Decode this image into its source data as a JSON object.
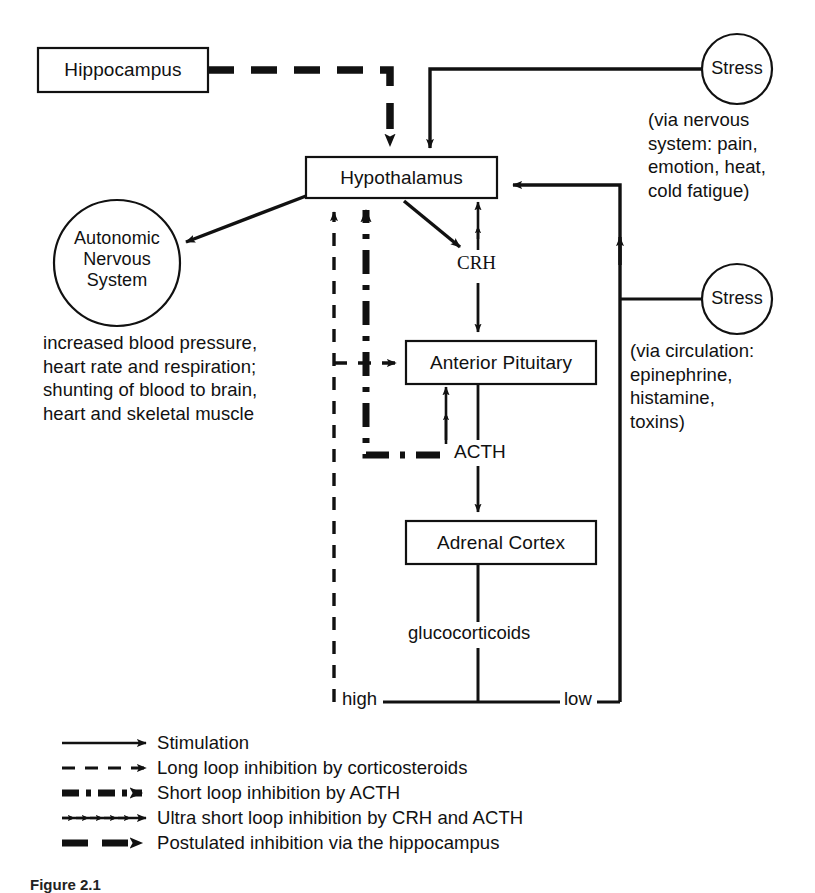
{
  "figure": {
    "caption": "Figure 2.1",
    "stroke_color": "#111111",
    "background": "#ffffff"
  },
  "nodes": {
    "hippocampus": {
      "label": "Hippocampus",
      "shape": "box"
    },
    "hypothalamus": {
      "label": "Hypothalamus",
      "shape": "box"
    },
    "anterior_pituitary": {
      "label": "Anterior Pituitary",
      "shape": "box"
    },
    "adrenal_cortex": {
      "label": "Adrenal Cortex",
      "shape": "box"
    },
    "stress_nervous": {
      "label": "Stress",
      "shape": "circle"
    },
    "stress_circulation": {
      "label": "Stress",
      "shape": "circle"
    },
    "autonomic": {
      "shape": "circle",
      "line1": "Autonomic",
      "line2": "Nervous",
      "line3": "System"
    }
  },
  "annotations": {
    "crh": "CRH",
    "acth": "ACTH",
    "glucocorticoids": "glucocorticoids",
    "high": "high",
    "low": "low"
  },
  "notes": {
    "nervous_system": {
      "line1": "(via nervous",
      "line2": "system: pain,",
      "line3": "emotion, heat,",
      "line4": "cold fatigue)"
    },
    "circulation": {
      "line1": "(via circulation:",
      "line2": "epinephrine,",
      "line3": "histamine,",
      "line4": "toxins)"
    },
    "autonomic_effects": {
      "line1": "increased blood pressure,",
      "line2": "heart rate and respiration;",
      "line3": "shunting of blood to brain,",
      "line4": "heart and skeletal muscle"
    }
  },
  "legend": {
    "items": [
      {
        "style": "solid",
        "label": "Stimulation"
      },
      {
        "style": "dashed",
        "label": "Long loop inhibition by corticosteroids"
      },
      {
        "style": "dash-dot-thick",
        "label": "Short loop inhibition  by ACTH"
      },
      {
        "style": "chevrons",
        "label": "Ultra short loop inhibition by  CRH and ACTH"
      },
      {
        "style": "thick-dashed",
        "label": "Postulated inhibition via the hippocampus"
      }
    ]
  }
}
